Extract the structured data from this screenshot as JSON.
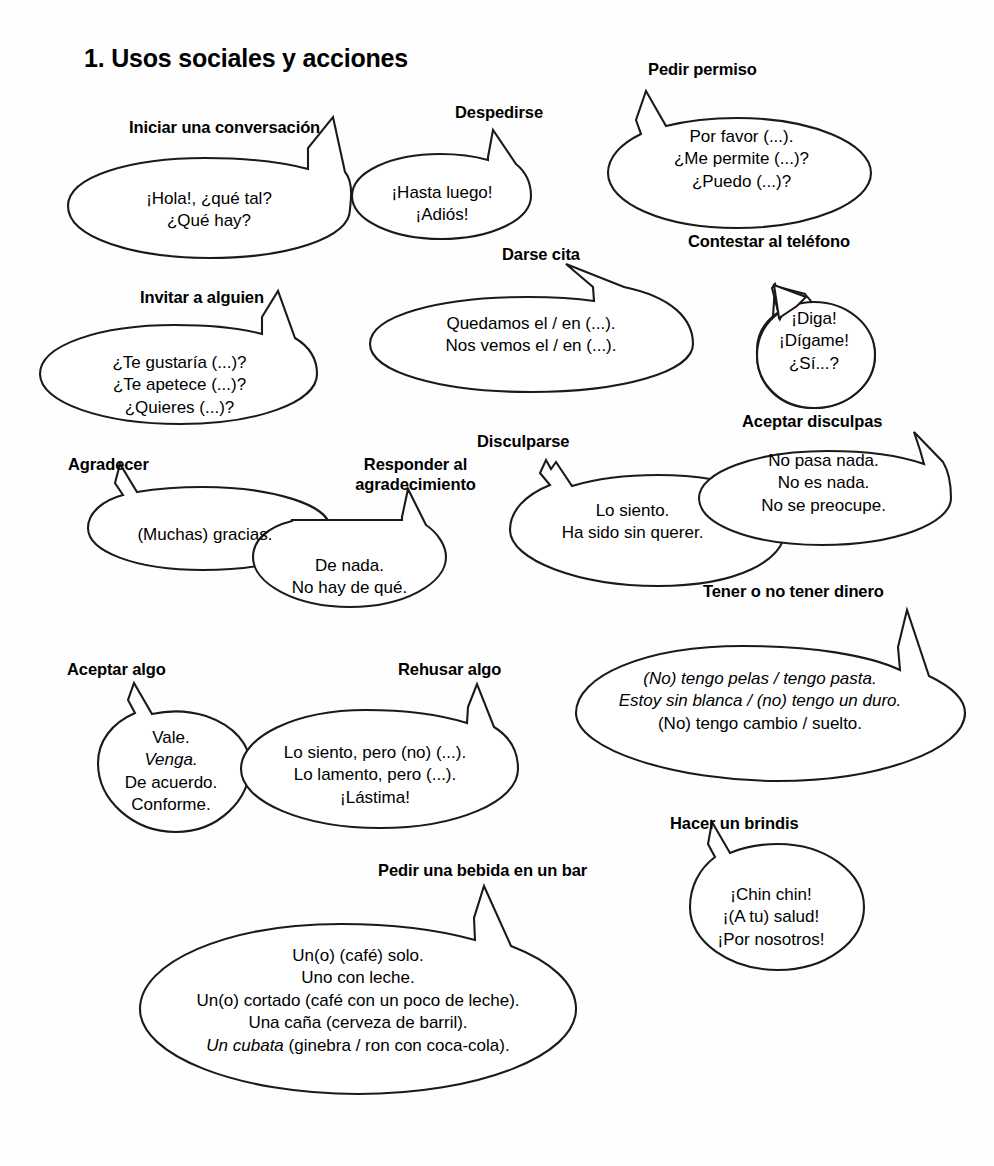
{
  "page": {
    "title": "1. Usos sociales y acciones",
    "background_color": "#ffffff",
    "ink_color": "#1a1a1a"
  },
  "groups": [
    {
      "id": "iniciar-una-conversacion",
      "label": "Iniciar una conversación",
      "lines": [
        "¡Hola!, ¿qué tal?",
        "¿Qué hay?"
      ]
    },
    {
      "id": "despedirse",
      "label": "Despedirse",
      "lines": [
        "¡Hasta luego!",
        "¡Adiós!"
      ]
    },
    {
      "id": "pedir-permiso",
      "label": "Pedir permiso",
      "lines": [
        "Por favor (...).",
        "¿Me permite (...)?",
        "¿Puedo (...)?"
      ]
    },
    {
      "id": "invitar-a-alguien",
      "label": "Invitar a alguien",
      "lines": [
        "¿Te gustaría (...)?",
        "¿Te apetece (...)?",
        "¿Quieres (...)?"
      ]
    },
    {
      "id": "darse-cita",
      "label": "Darse cita",
      "lines": [
        "Quedamos el / en (...).",
        "Nos vemos el / en (...)."
      ]
    },
    {
      "id": "contestar-al-telefono",
      "label": "Contestar al teléfono",
      "lines": [
        "¡Diga!",
        "¡Dígame!",
        "¿Sí...?"
      ]
    },
    {
      "id": "agradecer",
      "label": "Agradecer",
      "lines": [
        "(Muchas) gracias."
      ]
    },
    {
      "id": "responder-al-agradecimiento",
      "label": "Responder al agradecimiento",
      "lines": [
        "De nada.",
        "No hay de qué."
      ]
    },
    {
      "id": "disculparse",
      "label": "Disculparse",
      "lines": [
        "Lo siento.",
        "Ha sido sin querer."
      ]
    },
    {
      "id": "aceptar-disculpas",
      "label": "Aceptar disculpas",
      "lines": [
        "No pasa nada.",
        "No es nada.",
        "No se preocupe."
      ]
    },
    {
      "id": "tener-o-no-tener-dinero",
      "label": "Tener o no tener dinero",
      "lines": [
        "(No) tengo pelas / tengo pasta.",
        "Estoy sin blanca / (no) tengo un duro.",
        "(No) tengo cambio / suelto."
      ],
      "line_styles": [
        "italic",
        "italic",
        "roman"
      ]
    },
    {
      "id": "aceptar-algo",
      "label": "Aceptar algo",
      "lines": [
        "Vale.",
        "Venga.",
        "De acuerdo.",
        "Conforme."
      ],
      "line_styles": [
        "roman",
        "italic",
        "roman",
        "roman"
      ]
    },
    {
      "id": "rehusar-algo",
      "label": "Rehusar algo",
      "lines": [
        "Lo siento, pero (no) (...).",
        "Lo lamento, pero (...).",
        "¡Lástima!"
      ]
    },
    {
      "id": "hacer-un-brindis",
      "label": "Hacer un brindis",
      "lines": [
        "¡Chin chin!",
        "¡(A tu) salud!",
        "¡Por nosotros!"
      ]
    },
    {
      "id": "pedir-una-bebida-en-un-bar",
      "label": "Pedir una bebida en un bar",
      "lines": [
        "Un(o) (café) solo.",
        "Uno con leche.",
        "Un(o) cortado (café con un poco de leche).",
        "Una caña (cerveza de barril).",
        "Un cubata (ginebra / ron con coca-cola)."
      ],
      "line_styles": [
        "roman",
        "roman",
        "roman",
        "roman",
        "mixed-italic-lead"
      ],
      "italic_lead": "Un cubata",
      "italic_rest": " (ginebra / ron con coca-cola)."
    }
  ]
}
